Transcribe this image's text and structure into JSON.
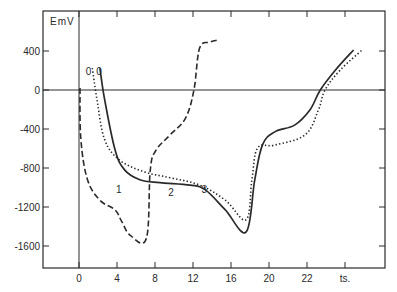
{
  "chart_data": {
    "type": "line",
    "title": "",
    "xlabel": "ts.",
    "ylabel": "EmV",
    "xlim": [
      -4.0,
      32.4
    ],
    "ylim": [
      -1850,
      800
    ],
    "grid": false,
    "legend": "none (curves labelled inline 1, 2, 3)",
    "x_ticks": [
      {
        "value": 0,
        "label": "0"
      },
      {
        "value": 4,
        "label": "4"
      },
      {
        "value": 8,
        "label": "8"
      },
      {
        "value": 12,
        "label": "12"
      },
      {
        "value": 16,
        "label": "16"
      },
      {
        "value": 20,
        "label": "20"
      },
      {
        "value": 24,
        "label": "22"
      },
      {
        "value": 28,
        "label": "ts."
      }
    ],
    "y_ticks": [
      {
        "value": 400,
        "label": "400"
      },
      {
        "value": 0,
        "label": "0"
      },
      {
        "value": -400,
        "label": "-400"
      },
      {
        "value": -800,
        "label": "-800"
      },
      {
        "value": -1200,
        "label": "-1200"
      },
      {
        "value": -1600,
        "label": "-1600"
      }
    ],
    "reference_lines": [
      {
        "type": "horizontal",
        "y": 0
      },
      {
        "type": "vertical",
        "x": 0
      }
    ],
    "annotations": [
      {
        "text": "0",
        "x": 1.0,
        "y": 200
      },
      {
        "text": "0",
        "x": 2.1,
        "y": 200
      },
      {
        "text": "1",
        "x": 4.2,
        "y": -1020
      },
      {
        "text": "2",
        "x": 9.7,
        "y": -1050
      },
      {
        "text": "3",
        "x": 13.2,
        "y": -1020
      }
    ],
    "series": [
      {
        "name": "1",
        "style": "dashed",
        "x": [
          0.1,
          0.2,
          0.9,
          2.2,
          3.8,
          4.5,
          5.4,
          7.1,
          7.5,
          8.1,
          9.6,
          11.2,
          12.1,
          12.7,
          13.8,
          14.5
        ],
        "y": [
          20,
          -510,
          -920,
          -1130,
          -1230,
          -1350,
          -1490,
          -1520,
          -820,
          -620,
          -460,
          -290,
          0,
          430,
          490,
          510
        ]
      },
      {
        "name": "2",
        "style": "solid",
        "x": [
          2.2,
          2.7,
          3.8,
          4.8,
          6.4,
          8.5,
          11.7,
          13.3,
          15.4,
          17.6,
          18.5,
          19.3,
          20.6,
          22.7,
          24.3,
          25.4,
          27.0,
          28.9
        ],
        "y": [
          225,
          -100,
          -615,
          -820,
          -920,
          -950,
          -975,
          -1025,
          -1230,
          -1455,
          -920,
          -565,
          -430,
          -360,
          -205,
          0,
          205,
          410
        ]
      },
      {
        "name": "3",
        "style": "dotted",
        "x": [
          1.4,
          1.9,
          2.7,
          4.3,
          6.9,
          9.6,
          12.7,
          15.4,
          17.6,
          18.2,
          18.8,
          20.6,
          23.8,
          25.2,
          25.9,
          27.5,
          29.8
        ],
        "y": [
          225,
          -100,
          -510,
          -720,
          -840,
          -900,
          -975,
          -1130,
          -1330,
          -920,
          -595,
          -565,
          -460,
          -205,
          0,
          205,
          410
        ]
      }
    ]
  }
}
